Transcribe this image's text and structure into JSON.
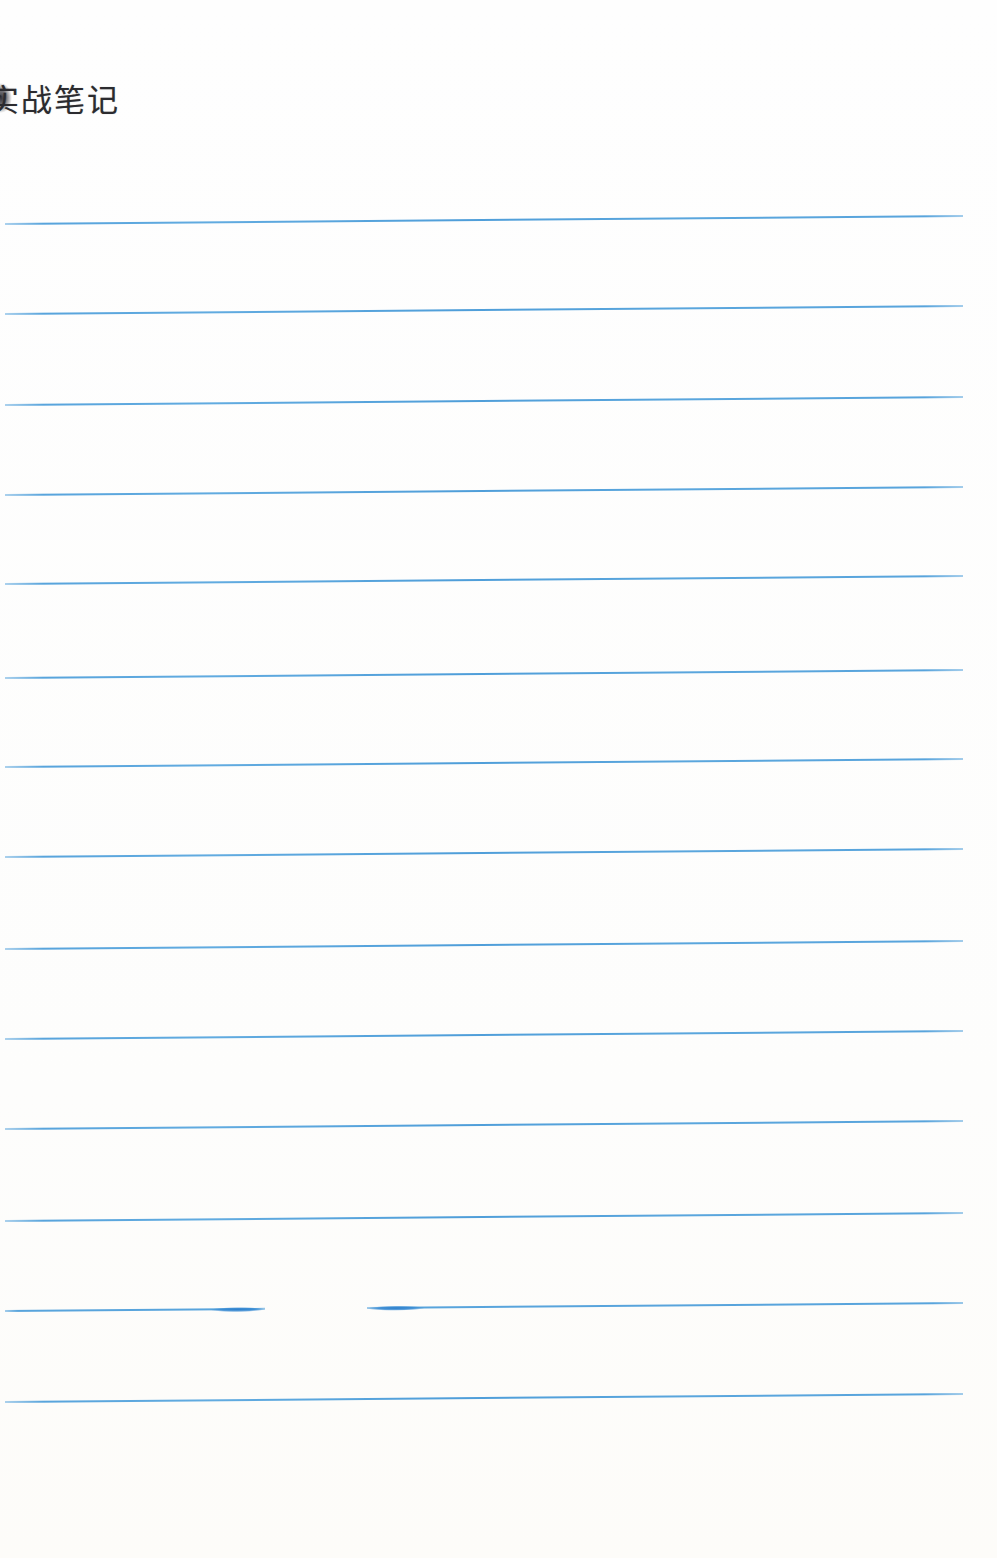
{
  "page": {
    "title": "实战笔记",
    "background_color": "#fefefe",
    "title_color": "#2b2b2f"
  },
  "ruling": {
    "line_color": "#58a4dc",
    "ink_blot_color": "#2e7fcb",
    "line_count": 14,
    "line_ys": [
      219,
      309,
      400,
      490,
      579,
      673,
      762,
      852,
      944,
      1034,
      1124,
      1216,
      1306,
      1397
    ],
    "broken_line": {
      "y": 1306,
      "gap_start_x": 265,
      "gap_end_x": 367
    }
  }
}
